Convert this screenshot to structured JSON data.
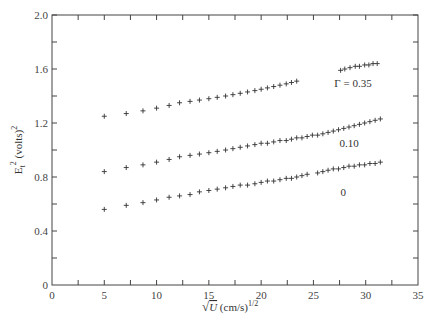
{
  "chart_data": {
    "type": "scatter",
    "title": "",
    "xlabel": "√U (cm/s)^1/2",
    "ylabel": "E_t^2 (volts)^2",
    "xlim": [
      0,
      35
    ],
    "ylim": [
      0,
      2.0
    ],
    "x_ticks": [
      "0",
      "5",
      "10",
      "15",
      "20",
      "25",
      "30",
      "35"
    ],
    "y_ticks": [
      "0",
      "0.4",
      "0.8",
      "1.2",
      "1.6",
      "2.0"
    ],
    "grid": false,
    "marker": "+",
    "series": [
      {
        "name": "Γ = 0.35",
        "label": "Γ = 0.35",
        "x": [
          5.0,
          7.1,
          8.7,
          10.0,
          11.2,
          12.2,
          13.2,
          14.1,
          15.0,
          15.8,
          16.6,
          17.3,
          18.0,
          18.7,
          19.4,
          20.0,
          20.6,
          21.2,
          21.8,
          22.4,
          22.9,
          23.4,
          27.6,
          28.0,
          28.5,
          29.0,
          29.4,
          29.9,
          30.3,
          30.7,
          31.1
        ],
        "y": [
          1.25,
          1.27,
          1.29,
          1.31,
          1.33,
          1.35,
          1.36,
          1.37,
          1.38,
          1.39,
          1.4,
          1.41,
          1.42,
          1.43,
          1.44,
          1.45,
          1.46,
          1.47,
          1.48,
          1.49,
          1.5,
          1.51,
          1.59,
          1.6,
          1.61,
          1.62,
          1.62,
          1.63,
          1.63,
          1.64,
          1.64
        ]
      },
      {
        "name": "Γ = 0.10",
        "label": "0.10",
        "x": [
          5.0,
          7.1,
          8.7,
          10.0,
          11.2,
          12.2,
          13.2,
          14.1,
          15.0,
          15.8,
          16.6,
          17.3,
          18.0,
          18.7,
          19.4,
          20.0,
          20.6,
          21.2,
          21.8,
          22.4,
          22.9,
          23.4,
          23.9,
          24.4,
          24.9,
          25.4,
          25.9,
          26.4,
          26.9,
          27.4,
          27.9,
          28.4,
          28.9,
          29.4,
          29.9,
          30.4,
          30.9,
          31.4
        ],
        "y": [
          0.84,
          0.87,
          0.89,
          0.91,
          0.93,
          0.95,
          0.96,
          0.97,
          0.98,
          0.99,
          1.0,
          1.01,
          1.02,
          1.03,
          1.04,
          1.05,
          1.05,
          1.06,
          1.07,
          1.07,
          1.08,
          1.09,
          1.09,
          1.1,
          1.11,
          1.11,
          1.12,
          1.13,
          1.14,
          1.15,
          1.16,
          1.17,
          1.18,
          1.19,
          1.2,
          1.21,
          1.22,
          1.23
        ]
      },
      {
        "name": "Γ = 0",
        "label": "0",
        "x": [
          5.0,
          7.1,
          8.7,
          10.0,
          11.2,
          12.2,
          13.2,
          14.1,
          15.0,
          15.8,
          16.6,
          17.3,
          18.0,
          18.7,
          19.4,
          20.0,
          20.6,
          21.2,
          21.8,
          22.4,
          22.9,
          23.4,
          23.9,
          24.4,
          25.4,
          25.9,
          26.4,
          26.9,
          27.4,
          27.9,
          28.4,
          28.9,
          29.4,
          29.9,
          30.4,
          30.9,
          31.4
        ],
        "y": [
          0.56,
          0.59,
          0.61,
          0.63,
          0.65,
          0.66,
          0.67,
          0.69,
          0.7,
          0.71,
          0.72,
          0.73,
          0.74,
          0.74,
          0.75,
          0.76,
          0.77,
          0.77,
          0.78,
          0.79,
          0.79,
          0.8,
          0.81,
          0.82,
          0.83,
          0.84,
          0.85,
          0.86,
          0.86,
          0.87,
          0.88,
          0.88,
          0.89,
          0.89,
          0.9,
          0.9,
          0.91
        ]
      }
    ],
    "annotations": [
      {
        "text": "Γ = 0.35",
        "x": 27.0,
        "y": 1.47
      },
      {
        "text": "0.10",
        "x": 27.5,
        "y": 1.02
      },
      {
        "text": "0",
        "x": 27.6,
        "y": 0.66
      }
    ]
  }
}
